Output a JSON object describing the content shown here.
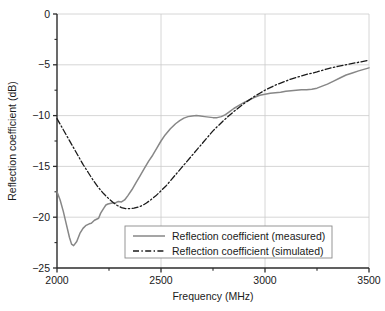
{
  "chart_data": {
    "type": "line",
    "title": "",
    "xlabel": "Frequency (MHz)",
    "ylabel": "Reflection coefficient (dB)",
    "xlim": [
      2000,
      3500
    ],
    "ylim": [
      -25,
      0
    ],
    "xticks": [
      2000,
      2500,
      3000,
      3500
    ],
    "yticks": [
      0,
      -5,
      -10,
      -15,
      -20,
      -25
    ],
    "xtick_labels": [
      "2000",
      "2500",
      "3000",
      "3500"
    ],
    "ytick_labels": [
      "0",
      "−5",
      "−10",
      "−15",
      "−20",
      "−25"
    ],
    "grid": true,
    "grid_color": "#cccccc",
    "legend_position": "lower center",
    "series": [
      {
        "name": "Reflection coefficient (measured)",
        "style": "solid",
        "color": "#878787",
        "x": [
          2000,
          2015,
          2030,
          2045,
          2060,
          2070,
          2080,
          2095,
          2110,
          2125,
          2140,
          2155,
          2165,
          2180,
          2190,
          2200,
          2210,
          2225,
          2235,
          2245,
          2255,
          2265,
          2280,
          2295,
          2310,
          2325,
          2340,
          2360,
          2380,
          2400,
          2420,
          2440,
          2460,
          2480,
          2500,
          2520,
          2545,
          2570,
          2590,
          2610,
          2630,
          2650,
          2670,
          2690,
          2710,
          2730,
          2750,
          2770,
          2790,
          2810,
          2830,
          2850,
          2875,
          2900,
          2925,
          2950,
          2975,
          3000,
          3025,
          3050,
          3075,
          3100,
          3125,
          3150,
          3175,
          3200,
          3225,
          3250,
          3275,
          3300,
          3330,
          3360,
          3390,
          3420,
          3450,
          3475,
          3500
        ],
        "y": [
          -17.5,
          -18.3,
          -19.4,
          -20.7,
          -22.0,
          -22.65,
          -22.8,
          -22.4,
          -21.6,
          -21.1,
          -20.8,
          -20.65,
          -20.6,
          -20.3,
          -20.2,
          -20.1,
          -19.6,
          -19.1,
          -18.8,
          -18.7,
          -18.65,
          -18.6,
          -18.6,
          -18.45,
          -18.5,
          -18.3,
          -17.9,
          -17.3,
          -16.6,
          -15.9,
          -15.2,
          -14.5,
          -13.9,
          -13.2,
          -12.5,
          -11.9,
          -11.3,
          -10.8,
          -10.5,
          -10.25,
          -10.1,
          -10.05,
          -10.0,
          -10.05,
          -10.1,
          -10.15,
          -10.2,
          -10.2,
          -10.1,
          -9.9,
          -9.6,
          -9.3,
          -9.0,
          -8.7,
          -8.45,
          -8.2,
          -8.0,
          -7.9,
          -7.8,
          -7.75,
          -7.7,
          -7.6,
          -7.55,
          -7.5,
          -7.45,
          -7.45,
          -7.4,
          -7.3,
          -7.1,
          -6.9,
          -6.6,
          -6.3,
          -6.0,
          -5.8,
          -5.6,
          -5.45,
          -5.3
        ]
      },
      {
        "name": "Reflection coefficient (simulated)",
        "style": "dashdot",
        "color": "#1a1a1a",
        "x": [
          2000,
          2025,
          2050,
          2075,
          2100,
          2125,
          2150,
          2175,
          2200,
          2225,
          2250,
          2270,
          2290,
          2310,
          2330,
          2350,
          2370,
          2390,
          2410,
          2430,
          2450,
          2475,
          2500,
          2525,
          2550,
          2575,
          2600,
          2625,
          2650,
          2675,
          2700,
          2725,
          2750,
          2775,
          2800,
          2825,
          2850,
          2875,
          2900,
          2925,
          2950,
          2975,
          3000,
          3025,
          3050,
          3075,
          3100,
          3125,
          3150,
          3175,
          3200,
          3250,
          3300,
          3350,
          3400,
          3450,
          3500
        ],
        "y": [
          -10.3,
          -11.2,
          -12.1,
          -13.0,
          -13.9,
          -14.8,
          -15.6,
          -16.4,
          -17.1,
          -17.7,
          -18.2,
          -18.55,
          -18.85,
          -19.05,
          -19.15,
          -19.15,
          -19.1,
          -19.0,
          -18.85,
          -18.6,
          -18.3,
          -17.9,
          -17.4,
          -16.9,
          -16.3,
          -15.7,
          -15.1,
          -14.5,
          -13.9,
          -13.3,
          -12.7,
          -12.1,
          -11.5,
          -11.0,
          -10.5,
          -10.05,
          -9.6,
          -9.2,
          -8.8,
          -8.45,
          -8.1,
          -7.8,
          -7.5,
          -7.25,
          -7.0,
          -6.8,
          -6.6,
          -6.4,
          -6.25,
          -6.1,
          -5.95,
          -5.7,
          -5.4,
          -5.15,
          -4.95,
          -4.75,
          -4.55
        ]
      }
    ]
  },
  "legend": {
    "items": [
      {
        "label": "Reflection coefficient (measured)",
        "style": "solid"
      },
      {
        "label": "Reflection coefficient (simulated)",
        "style": "dashdot"
      }
    ]
  }
}
